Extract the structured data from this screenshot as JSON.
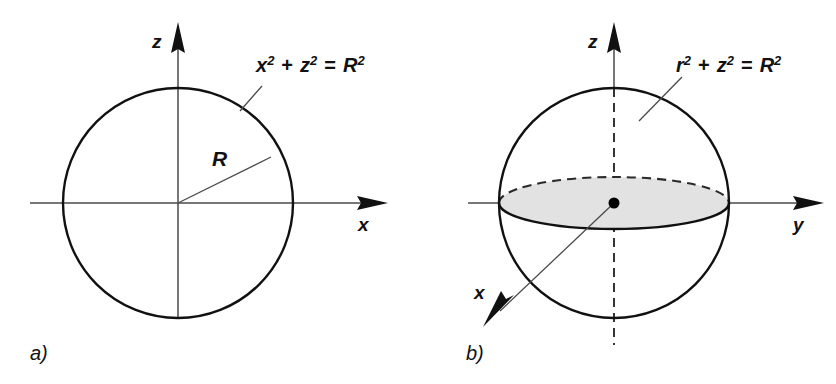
{
  "figure": {
    "background_color": "#ffffff",
    "line_color": "#111111",
    "axis_color": "#4a4a4a",
    "disk_fill_color": "#e2e2e2",
    "width": 836,
    "height": 384
  },
  "panels": [
    {
      "id": "a",
      "label": "a)",
      "caption_position": {
        "x": 30,
        "y": 360
      },
      "geometry": {
        "center": {
          "x": 178,
          "y": 203
        },
        "radius": 115,
        "shape": "circle"
      },
      "equation": {
        "text": "x2 + z2 = R2",
        "parts": [
          "x",
          "2",
          " + ",
          "z",
          "2",
          " = ",
          "R",
          "2"
        ],
        "base_vars": [
          "x",
          "z",
          "R"
        ],
        "exponent": "2",
        "position": {
          "x": 256,
          "y": 72
        }
      },
      "radius_annotation": {
        "label": "R",
        "from": {
          "x": 178,
          "y": 203
        },
        "to": {
          "x": 271,
          "y": 157
        },
        "label_position": {
          "x": 212,
          "y": 166
        }
      },
      "axes": [
        {
          "name": "z",
          "label": "z",
          "direction": "up",
          "from": {
            "x": 178,
            "y": 318
          },
          "to": {
            "x": 178,
            "y": 22
          },
          "label_position": {
            "x": 152,
            "y": 48
          },
          "style": "solid",
          "arrow": true
        },
        {
          "name": "x",
          "label": "x",
          "direction": "right",
          "from": {
            "x": 30,
            "y": 203
          },
          "to": {
            "x": 388,
            "y": 203
          },
          "label_position": {
            "x": 358,
            "y": 231
          },
          "style": "solid",
          "arrow": true
        }
      ]
    },
    {
      "id": "b",
      "label": "b)",
      "caption_position": {
        "x": 466,
        "y": 360
      },
      "geometry": {
        "center": {
          "x": 614,
          "y": 203
        },
        "radius": 115,
        "shape": "sphere",
        "equator_ellipse": {
          "rx": 115,
          "ry": 26,
          "front_style": "solid",
          "back_style": "dashed"
        },
        "center_dot_radius": 5.5
      },
      "equation": {
        "text": "r2 + z2 = R2",
        "parts": [
          "r",
          "2",
          " + ",
          "z",
          "2",
          " = ",
          "R",
          "2"
        ],
        "base_vars": [
          "r",
          "z",
          "R"
        ],
        "exponent": "2",
        "position": {
          "x": 676,
          "y": 72
        }
      },
      "axes": [
        {
          "name": "z",
          "label": "z",
          "direction": "up",
          "from": {
            "x": 614,
            "y": 345
          },
          "to": {
            "x": 614,
            "y": 22
          },
          "label_position": {
            "x": 588,
            "y": 48
          },
          "style": "solid-outside-dashed-inside",
          "arrow": true
        },
        {
          "name": "y",
          "label": "y",
          "direction": "right",
          "from": {
            "x": 468,
            "y": 203
          },
          "to": {
            "x": 824,
            "y": 203
          },
          "label_position": {
            "x": 793,
            "y": 231
          },
          "style": "solid-outside-dashed-inside",
          "arrow": true
        },
        {
          "name": "x",
          "label": "x",
          "direction": "down-left",
          "from": {
            "x": 614,
            "y": 203
          },
          "to": {
            "x": 483,
            "y": 327
          },
          "label_position": {
            "x": 474,
            "y": 299
          },
          "style": "solid",
          "arrow": true
        }
      ]
    }
  ]
}
